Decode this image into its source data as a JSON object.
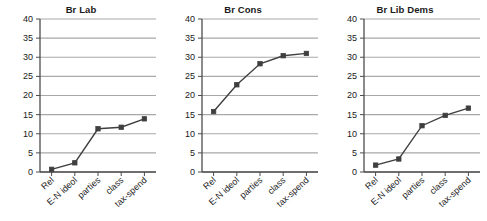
{
  "chart_data": [
    {
      "type": "line",
      "title": "Br Lab",
      "categories": [
        "Rel",
        "E-N ideol",
        "parties",
        "class",
        "tax-spend"
      ],
      "values": [
        0.7,
        2.4,
        11.3,
        11.7,
        13.9
      ],
      "xlabel": "",
      "ylabel": "",
      "ylim": [
        0,
        40
      ],
      "yticks": [
        0,
        5,
        10,
        15,
        20,
        25,
        30,
        35,
        40
      ],
      "grid": true,
      "legend": "none",
      "marker": "square",
      "series_color": "#3f3f3f"
    },
    {
      "type": "line",
      "title": "Br Cons",
      "categories": [
        "Rel",
        "E-N ideol",
        "parties",
        "class",
        "tax-spend"
      ],
      "values": [
        15.8,
        22.8,
        28.3,
        30.4,
        31.0
      ],
      "xlabel": "",
      "ylabel": "",
      "ylim": [
        0,
        40
      ],
      "yticks": [
        0,
        5,
        10,
        15,
        20,
        25,
        30,
        35,
        40
      ],
      "grid": true,
      "legend": "none",
      "marker": "square",
      "series_color": "#3f3f3f"
    },
    {
      "type": "line",
      "title": "Br Lib Dems",
      "categories": [
        "Rel",
        "E-N ideol",
        "parties",
        "class",
        "tax-spend"
      ],
      "values": [
        1.8,
        3.4,
        12.1,
        14.8,
        16.7
      ],
      "xlabel": "",
      "ylabel": "",
      "ylim": [
        0,
        40
      ],
      "yticks": [
        0,
        5,
        10,
        15,
        20,
        25,
        30,
        35,
        40
      ],
      "grid": true,
      "legend": "none",
      "marker": "square",
      "series_color": "#3f3f3f"
    }
  ],
  "style": {
    "grid_color": "#a8a8a8",
    "axis_color": "#4d4d4d",
    "text_color": "#1a1a1a",
    "background": "#ffffff"
  }
}
